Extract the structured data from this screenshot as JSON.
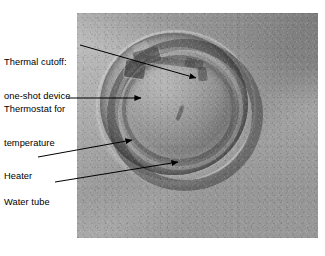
{
  "figure": {
    "kind": "annotated-photograph",
    "background_color": "#ffffff",
    "photo": {
      "name": "water-heater-opening-photo",
      "description": "Grayscale photograph of a circular opening in a water heater tank showing the heater coil, water tube and mounted thermal controls",
      "x": 77,
      "y": 13,
      "width": 241,
      "height": 225,
      "base_color": "#9a9a9a"
    },
    "line_color": "#000000",
    "text_color": "#000000"
  },
  "callouts": [
    {
      "id": "thermal-cutoff",
      "lines": [
        "Thermal cutoff:",
        "one-shot device"
      ],
      "line1": "Thermal cutoff:",
      "line2": "one-shot device",
      "leader": {
        "x1": 80,
        "y1": 45,
        "x2": 196,
        "y2": 78
      }
    },
    {
      "id": "thermostat",
      "lines": [
        "Thermostat for",
        "temperature"
      ],
      "line1": "Thermostat for",
      "line2": "temperature",
      "leader": {
        "x1": 68,
        "y1": 98,
        "x2": 141,
        "y2": 98
      }
    },
    {
      "id": "heater",
      "lines": [
        "Heater"
      ],
      "line1": "Heater",
      "leader": {
        "x1": 38,
        "y1": 157,
        "x2": 132,
        "y2": 140
      }
    },
    {
      "id": "water-tube",
      "lines": [
        "Water tube"
      ],
      "line1": "Water tube",
      "leader": {
        "x1": 55,
        "y1": 182,
        "x2": 178,
        "y2": 162
      }
    }
  ]
}
